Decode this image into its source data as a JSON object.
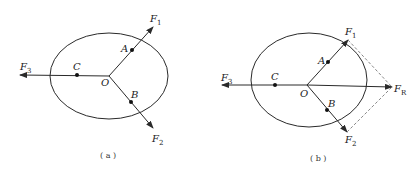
{
  "panels": [
    {
      "id": "a",
      "caption": "( a )",
      "points": {
        "O": "O",
        "A": "A",
        "B": "B",
        "C": "C"
      },
      "forces": [
        {
          "name": "F",
          "sub": "1"
        },
        {
          "name": "F",
          "sub": "2"
        },
        {
          "name": "F",
          "sub": "3"
        }
      ]
    },
    {
      "id": "b",
      "caption": "( b )",
      "points": {
        "O": "O",
        "A": "A",
        "B": "B",
        "C": "C"
      },
      "forces": [
        {
          "name": "F",
          "sub": "1"
        },
        {
          "name": "F",
          "sub": "2"
        },
        {
          "name": "F",
          "sub": "3"
        },
        {
          "name": "F",
          "sub": "R"
        }
      ]
    }
  ],
  "colors": {
    "line": "#2a2a2a",
    "dashed": "#888888"
  }
}
